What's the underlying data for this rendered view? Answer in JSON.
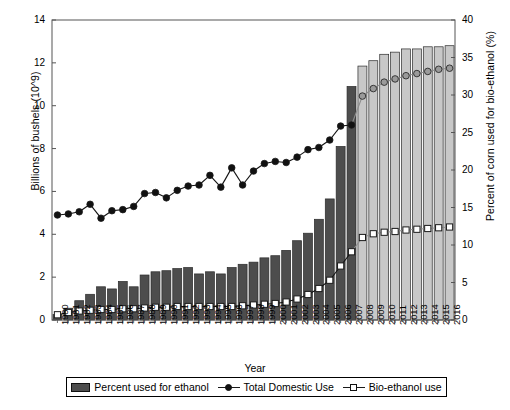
{
  "chart_data": {
    "type": "bar",
    "title": "",
    "xlabel": "Year",
    "ylabel": "Billions of bushels (10^9)",
    "ylabel_right": "Percent of corn used for bio-ethanol (%)",
    "ylim": [
      0,
      14
    ],
    "ylim_right": [
      0,
      40
    ],
    "yticks": [
      0,
      2,
      4,
      6,
      8,
      10,
      12,
      14
    ],
    "yticks_right": [
      0,
      5,
      10,
      15,
      20,
      25,
      30,
      35,
      40
    ],
    "grid": false,
    "legend_position": "bottom",
    "categories": [
      "1980",
      "1981",
      "1982",
      "1983",
      "1984",
      "1985",
      "1986",
      "1987",
      "1988",
      "1989",
      "1990",
      "1991",
      "1992",
      "1993",
      "1994",
      "1995",
      "1996",
      "1997",
      "1998",
      "1999",
      "2000",
      "2001",
      "2002",
      "2003",
      "2004",
      "2005",
      "2006",
      "2007",
      "2008",
      "2009",
      "2010",
      "2011",
      "2012",
      "2013",
      "2014",
      "2015",
      "2016"
    ],
    "series": [
      {
        "name": "Percent used for ethanol",
        "kind": "bar",
        "axis": "left",
        "unit": "billions of bushels",
        "color_historic": "#4d4d4d",
        "color_projected": "#c8c8c8",
        "projected_from": "2008",
        "values": [
          0.25,
          0.55,
          0.9,
          1.2,
          1.55,
          1.45,
          1.8,
          1.55,
          2.1,
          2.25,
          2.3,
          2.4,
          2.45,
          2.15,
          2.25,
          2.15,
          2.45,
          2.6,
          2.7,
          2.9,
          3.0,
          3.25,
          3.7,
          4.05,
          4.7,
          5.65,
          8.1,
          10.9,
          11.85,
          12.1,
          12.4,
          12.5,
          12.65,
          12.65,
          12.75,
          12.75,
          12.8
        ]
      },
      {
        "name": "Total Domestic Use",
        "kind": "line",
        "marker": "circle-filled",
        "axis": "left",
        "unit": "billions of bushels",
        "color_historic": "#111111",
        "color_projected": "#8c8c8c",
        "projected_from": "2008",
        "values": [
          4.9,
          4.95,
          5.05,
          5.4,
          4.75,
          5.1,
          5.15,
          5.3,
          5.9,
          5.95,
          5.7,
          6.05,
          6.25,
          6.3,
          6.75,
          6.2,
          7.1,
          6.3,
          6.95,
          7.3,
          7.4,
          7.35,
          7.6,
          7.95,
          8.05,
          8.4,
          9.05,
          9.1,
          10.45,
          10.8,
          11.1,
          11.25,
          11.4,
          11.5,
          11.6,
          11.7,
          11.75
        ]
      },
      {
        "name": "Bio-ethanol use",
        "kind": "line",
        "marker": "square-open",
        "axis": "right",
        "unit": "percent",
        "color_historic": "#111111",
        "color_projected": "#8c8c8c",
        "projected_from": "2008",
        "values": [
          0.7,
          1.0,
          1.2,
          1.3,
          1.4,
          1.4,
          1.5,
          1.5,
          1.6,
          1.7,
          1.7,
          1.8,
          1.8,
          1.8,
          1.8,
          1.8,
          1.8,
          1.9,
          2.0,
          2.1,
          2.2,
          2.4,
          2.8,
          3.4,
          4.2,
          5.3,
          7.2,
          9.1,
          11.0,
          11.5,
          11.7,
          11.8,
          12.0,
          12.1,
          12.2,
          12.3,
          12.4
        ]
      }
    ]
  },
  "legend": {
    "items": [
      {
        "label": "Percent used for ethanol",
        "marker": "bar-swatch"
      },
      {
        "label": "Total Domestic Use",
        "marker": "line-filled-circle"
      },
      {
        "label": "Bio-ethanol use",
        "marker": "line-open-square"
      }
    ]
  },
  "colors": {
    "bar_historic": "#4d4d4d",
    "bar_projected": "#c8c8c8",
    "marker_historic": "#111111",
    "marker_projected": "#8c8c8c",
    "axis": "#555555",
    "background": "#ffffff"
  }
}
